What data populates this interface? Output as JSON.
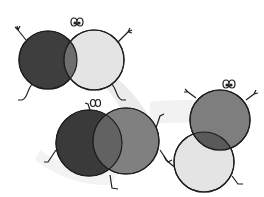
{
  "image": {
    "description": "Clip-art illustration of three pairs of overlapping cartoon circles with faces, arms and legs",
    "colors": {
      "background": "#ffffff",
      "swoosh": "#e6e6e6",
      "dark": "#3e3e3e",
      "medium": "#7e7e7e",
      "overlap": "#6a6a6a",
      "light": "#e4e4e4",
      "outline": "#1e1e1e"
    },
    "pairs": [
      {
        "name": "pair-top-left",
        "left": {
          "cx": 48,
          "cy": 60,
          "r": 29,
          "fill": "dark"
        },
        "right": {
          "cx": 94,
          "cy": 60,
          "r": 30,
          "fill": "light"
        }
      },
      {
        "name": "pair-bottom-middle",
        "left": {
          "cx": 89,
          "cy": 143,
          "r": 33,
          "fill": "dark"
        },
        "right": {
          "cx": 126,
          "cy": 141,
          "r": 33,
          "fill": "medium"
        }
      },
      {
        "name": "pair-right",
        "top": {
          "cx": 220,
          "cy": 120,
          "r": 30,
          "fill": "medium"
        },
        "bottom": {
          "cx": 204,
          "cy": 162,
          "r": 30,
          "fill": "light"
        }
      }
    ]
  }
}
